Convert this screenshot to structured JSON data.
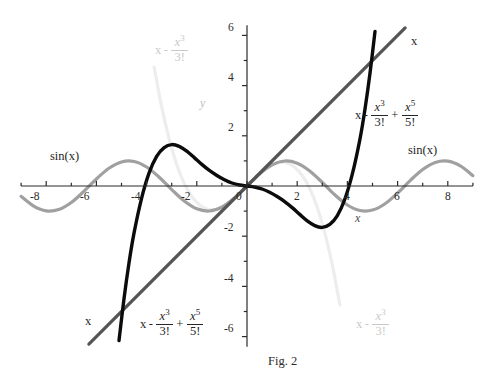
{
  "figure": {
    "caption": "Fig. 2",
    "axis_x_name": "x",
    "axis_y_name": "y"
  },
  "chart_data": {
    "type": "line",
    "title": "Fig. 2",
    "xlabel": "x",
    "ylabel": "y",
    "xlim": [
      -9,
      9
    ],
    "ylim": [
      -6.4,
      6.4
    ],
    "grid": false,
    "legend": "inline-curve-labels",
    "xticks": [
      -8,
      -6,
      -4,
      -2,
      0,
      2,
      4,
      6,
      8
    ],
    "xtick_labels": [
      "-8",
      "-6",
      "-4",
      "-2",
      "0",
      "2",
      "4",
      "6",
      "8"
    ],
    "yticks": [
      6,
      4,
      2,
      -2,
      -4,
      -6
    ],
    "ytick_labels": [
      "6",
      "4",
      "2",
      "-2",
      "-4",
      "-6"
    ],
    "minor_tick_step": 1,
    "series": [
      {
        "name": "sin(x)",
        "expression": "sin(x)",
        "color": "#a0a0a0",
        "width": 3.2,
        "x": [
          -9,
          -8.5,
          -8,
          -7.5,
          -7,
          -6.5,
          -6,
          -5.5,
          -5,
          -4.5,
          -4,
          -3.5,
          -3,
          -2.5,
          -2,
          -1.5,
          -1,
          -0.5,
          0,
          0.5,
          1,
          1.5,
          2,
          2.5,
          3,
          3.5,
          4,
          4.5,
          5,
          5.5,
          6,
          6.5,
          7,
          7.5,
          8,
          8.5,
          9
        ],
        "values": [
          -0.412,
          -0.798,
          -0.989,
          -0.938,
          -0.657,
          -0.215,
          0.279,
          0.706,
          0.959,
          0.978,
          0.757,
          0.351,
          -0.141,
          -0.598,
          -0.909,
          -0.997,
          -0.841,
          -0.479,
          0,
          0.479,
          0.841,
          0.997,
          0.909,
          0.598,
          0.141,
          -0.351,
          -0.757,
          -0.978,
          -0.959,
          -0.706,
          -0.279,
          0.215,
          0.657,
          0.938,
          0.989,
          0.798,
          0.412
        ]
      },
      {
        "name": "x",
        "expression": "x",
        "color": "#555555",
        "width": 3.2,
        "x": [
          -6.3,
          6.3
        ],
        "values": [
          -6.3,
          6.3
        ]
      },
      {
        "name": "x - x^3/3!",
        "expression": "x - x^3/3!",
        "color": "#ededed",
        "width": 3.2,
        "x": [
          -3.7,
          -3.4,
          -3.1,
          -2.8,
          -2.5,
          -2.2,
          -1.9,
          -1.6,
          -1.3,
          -1.0,
          -0.7,
          -0.4,
          0,
          0.4,
          0.7,
          1.0,
          1.3,
          1.6,
          1.9,
          2.2,
          2.5,
          2.8,
          3.1,
          3.4,
          3.7
        ],
        "values": [
          4.74,
          3.15,
          1.87,
          0.86,
          0.1,
          -0.42,
          -0.75,
          -0.92,
          -0.94,
          -0.83,
          -0.64,
          -0.39,
          0,
          0.39,
          0.64,
          0.83,
          0.94,
          0.92,
          0.75,
          0.42,
          -0.1,
          -0.86,
          -1.87,
          -3.15,
          -4.74
        ]
      },
      {
        "name": "x - x^3/3! + x^5/5!",
        "expression": "x - x^3/3! + x^5/5!",
        "color": "#0b0b0b",
        "width": 3.4,
        "x": [
          -5.1,
          -4.9,
          -4.7,
          -4.5,
          -4.2,
          -3.9,
          -3.6,
          -3.3,
          -3.0,
          -2.7,
          -2.4,
          -2.1,
          -1.8,
          -1.5,
          -1.2,
          -0.9,
          -0.6,
          -0.3,
          0,
          0.3,
          0.6,
          0.9,
          1.2,
          1.5,
          1.8,
          2.1,
          2.4,
          2.7,
          3.0,
          3.3,
          3.6,
          3.9,
          4.2,
          4.5,
          4.7,
          4.9,
          5.1
        ],
        "values": [
          -6.16,
          -4.49,
          -3.06,
          -1.87,
          -0.49,
          0.52,
          1.18,
          1.53,
          1.65,
          1.58,
          1.39,
          1.13,
          0.86,
          0.62,
          0.42,
          0.25,
          0.12,
          0.04,
          0,
          -0.04,
          -0.12,
          -0.25,
          -0.42,
          -0.62,
          -0.86,
          -1.13,
          -1.39,
          -1.58,
          -1.65,
          -1.53,
          -1.18,
          -0.52,
          0.49,
          1.87,
          3.06,
          4.49,
          6.16
        ]
      }
    ],
    "annotations": [
      {
        "id": "label-sinx-left",
        "text": "sin(x)",
        "x": -7.4,
        "y": 1.18
      },
      {
        "id": "label-sinx-right",
        "text": "sin(x)",
        "x": 6.6,
        "y": 1.32
      },
      {
        "id": "label-x-top",
        "text": "x",
        "x": 6.6,
        "y": 5.45
      },
      {
        "id": "label-x-bottom",
        "text": "x",
        "x": -6.5,
        "y": -5.0
      },
      {
        "id": "label-taylor3-top",
        "text": "x - x^3/3!",
        "x": -3.7,
        "y": 5.6
      },
      {
        "id": "label-taylor3-bottom",
        "text": "x - x^3/3!",
        "x": 4.6,
        "y": -4.9
      },
      {
        "id": "label-taylor5-right",
        "text": "x - x^3/3! + x^5/5!",
        "x": 4.3,
        "y": 2.9
      },
      {
        "id": "label-taylor5-bottom",
        "text": "x - x^3/3! + x^5/5!",
        "x": -4.2,
        "y": -5.0
      }
    ]
  },
  "labels": {
    "sin_left": "sin(x)",
    "sin_right": "sin(x)",
    "x_top": "x",
    "x_bottom": "x",
    "tick_x_neg8": "-8",
    "tick_x_neg6": "-6",
    "tick_x_neg4": "-4",
    "tick_x_neg2": "-2",
    "tick_x_0": "0",
    "tick_x_2": "2",
    "tick_x_4": "4",
    "tick_x_6": "6",
    "tick_x_8": "8",
    "tick_y_6": "6",
    "tick_y_4": "4",
    "tick_y_2": "2",
    "tick_y_neg2": "-2",
    "tick_y_neg4": "-4",
    "tick_y_neg6": "-6",
    "math_x": "x",
    "math_minus": "-",
    "math_plus": "+",
    "math_num3": "x",
    "math_exp3": "3",
    "math_den3": "3!",
    "math_num5": "x",
    "math_exp5": "5",
    "math_den5": "5!"
  }
}
